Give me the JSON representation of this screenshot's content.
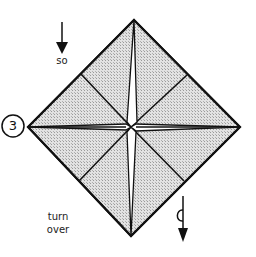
{
  "diagram": {
    "type": "origami-fold-step",
    "step_number": "3",
    "instruction_top": "so",
    "instruction_bottom": [
      "turn",
      "over"
    ],
    "colors": {
      "paper_fill": "#d4d4d4",
      "line": "#111111",
      "background": "#ffffff",
      "crease_highlight": "#ffffff"
    },
    "shape": {
      "outline": "diamond (square base / preliminary fold)",
      "vertices": {
        "top": [
          134,
          20
        ],
        "right": [
          240,
          127
        ],
        "bottom": [
          131,
          236
        ],
        "left": [
          28,
          127
        ]
      },
      "center": [
        131,
        127
      ],
      "edge_midpoints": {
        "upper_left": [
          81,
          74
        ],
        "upper_right": [
          187,
          75
        ],
        "lower_right": [
          184,
          181
        ],
        "lower_left": [
          79,
          181
        ]
      }
    },
    "symbols": [
      {
        "name": "push-down-arrow",
        "label": "so"
      },
      {
        "name": "turn-over-arrow",
        "label": "turn over"
      },
      {
        "name": "step-number-circle",
        "label": "3"
      }
    ]
  }
}
